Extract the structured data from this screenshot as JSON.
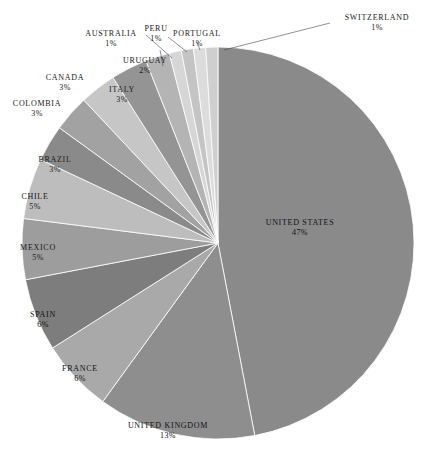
{
  "chart_data": {
    "type": "pie",
    "title": "",
    "subtitle": "",
    "xlabel": "",
    "ylabel": "",
    "legend_position": "none",
    "grid": false,
    "label_format": "NAME\npercent%",
    "start_angle_deg": 0,
    "direction": "clockwise",
    "categories": [
      "UNITED STATES",
      "UNITED KINGDOM",
      "FRANCE",
      "SPAIN",
      "MEXICO",
      "CHILE",
      "BRAZIL",
      "COLOMBIA",
      "CANADA",
      "ITALY",
      "URUGUAY",
      "PORTUGAL",
      "PERU",
      "AUSTRALIA",
      "SWITZERLAND"
    ],
    "values": [
      47,
      13,
      6,
      6,
      5,
      5,
      3,
      3,
      3,
      3,
      2,
      1,
      1,
      1,
      1
    ],
    "value_labels": [
      "47%",
      "13%",
      "6%",
      "6%",
      "5%",
      "5%",
      "3%",
      "3%",
      "3%",
      "3%",
      "2%",
      "1%",
      "1%",
      "1%",
      "1%"
    ],
    "colors": [
      "#8a8a8a",
      "#8e8e8e",
      "#a9a9a9",
      "#7d7d7d",
      "#9d9d9d",
      "#bdbdbd",
      "#8a8a8a",
      "#a2a2a2",
      "#c6c6c6",
      "#949494",
      "#b4b4b4",
      "#d6d6d6",
      "#c4c4c4",
      "#dcdcdc",
      "#cfcfcf"
    ],
    "total": 100,
    "units": "percent"
  },
  "slices": [
    {
      "name": "UNITED STATES",
      "pct": "47%",
      "label_x": 300,
      "label_y": 218,
      "placement": "inner"
    },
    {
      "name": "UNITED KINGDOM",
      "pct": "13%",
      "label_x": 168,
      "label_y": 421,
      "placement": "inner"
    },
    {
      "name": "FRANCE",
      "pct": "6%",
      "label_x": 80,
      "label_y": 364,
      "placement": "inner"
    },
    {
      "name": "SPAIN",
      "pct": "6%",
      "label_x": 43,
      "label_y": 310,
      "placement": "inner"
    },
    {
      "name": "MEXICO",
      "pct": "5%",
      "label_x": 38,
      "label_y": 243,
      "placement": "outer"
    },
    {
      "name": "CHILE",
      "pct": "5%",
      "label_x": 35,
      "label_y": 192,
      "placement": "outer"
    },
    {
      "name": "BRAZIL",
      "pct": "3%",
      "label_x": 55,
      "label_y": 155,
      "placement": "outer"
    },
    {
      "name": "COLOMBIA",
      "pct": "3%",
      "label_x": 37,
      "label_y": 99,
      "placement": "outer"
    },
    {
      "name": "CANADA",
      "pct": "3%",
      "label_x": 65,
      "label_y": 73,
      "placement": "outer"
    },
    {
      "name": "ITALY",
      "pct": "3%",
      "label_x": 122,
      "label_y": 85,
      "placement": "outer"
    },
    {
      "name": "URUGUAY",
      "pct": "2%",
      "label_x": 145,
      "label_y": 56,
      "placement": "outer"
    },
    {
      "name": "PORTUGAL",
      "pct": "1%",
      "label_x": 197,
      "label_y": 29,
      "placement": "outer"
    },
    {
      "name": "PERU",
      "pct": "1%",
      "label_x": 156,
      "label_y": 24,
      "placement": "outer"
    },
    {
      "name": "AUSTRALIA",
      "pct": "1%",
      "label_x": 111,
      "label_y": 29,
      "placement": "outer"
    },
    {
      "name": "SWITZERLAND",
      "pct": "1%",
      "label_x": 377,
      "label_y": 13,
      "placement": "outer"
    }
  ],
  "geometry": {
    "center_x": 218,
    "center_y": 243,
    "radius": 196
  }
}
